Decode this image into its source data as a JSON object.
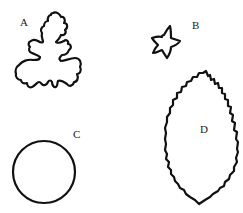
{
  "figure": {
    "background": "#ffffff",
    "stroke_color": "#111111",
    "shapes": [
      {
        "id": "A",
        "label": "A",
        "description": "lobed leaf (oak/geranium-like) outline"
      },
      {
        "id": "B",
        "label": "B",
        "description": "five-pointed flower/star outline"
      },
      {
        "id": "C",
        "label": "C",
        "description": "circle outline"
      },
      {
        "id": "D",
        "label": "D",
        "description": "serrated elliptical leaf outline"
      }
    ]
  }
}
